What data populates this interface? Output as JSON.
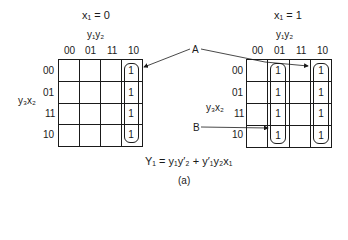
{
  "left_map": {
    "title": "x₁ = 0",
    "col_var": "y₁y₂",
    "row_var": "y₃x₂",
    "col_labels": [
      "00",
      "01",
      "11",
      "10"
    ],
    "row_labels": [
      "00",
      "01",
      "11",
      "10"
    ],
    "cells": [
      [
        "",
        "",
        "",
        "1"
      ],
      [
        "",
        "",
        "",
        "1"
      ],
      [
        "",
        "",
        "",
        "1"
      ],
      [
        "",
        "",
        "",
        "1"
      ]
    ]
  },
  "right_map": {
    "title": "x₁ = 1",
    "col_var": "y₁y₂",
    "row_var": "y₃x₂",
    "col_labels": [
      "00",
      "01",
      "11",
      "10"
    ],
    "row_labels": [
      "00",
      "01",
      "11",
      "10"
    ],
    "cells": [
      [
        "",
        "1",
        "",
        "1"
      ],
      [
        "",
        "1",
        "",
        "1"
      ],
      [
        "",
        "1",
        "",
        "1"
      ],
      [
        "",
        "1",
        "",
        "1"
      ]
    ]
  },
  "labels": {
    "A": "A",
    "B": "B"
  },
  "equation": "Y₁ = y₁y′₂ + y′₁y₂x₁",
  "caption": "(a)"
}
